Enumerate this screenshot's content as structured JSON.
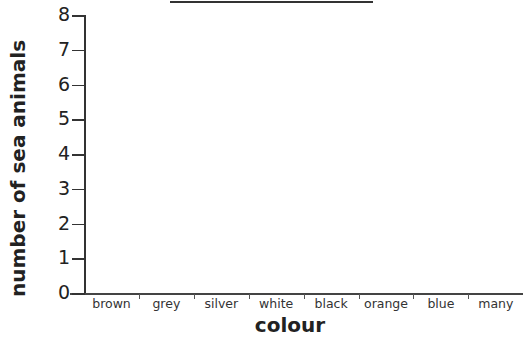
{
  "chart_data": {
    "type": "bar",
    "title": "",
    "xlabel": "colour",
    "ylabel": "number of sea animals",
    "categories": [
      "brown",
      "grey",
      "silver",
      "white",
      "black",
      "orange",
      "blue",
      "many"
    ],
    "values": [
      null,
      null,
      null,
      null,
      null,
      null,
      null,
      null
    ],
    "ylim": [
      0,
      8
    ],
    "yticks": [
      "0",
      "1",
      "2",
      "3",
      "4",
      "5",
      "6",
      "7",
      "8"
    ],
    "grid": false,
    "legend": null,
    "note": "Blank bar chart template; no bars drawn. Title is cut off at top edge (only underline visible)."
  },
  "axes": {
    "x_title": "colour",
    "y_title": "number of sea animals"
  }
}
